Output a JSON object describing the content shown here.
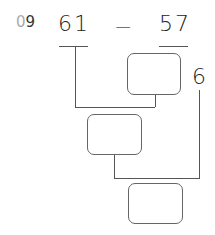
{
  "problem": {
    "number_prefix": "0",
    "number_suffix": "9",
    "left_operand": "61",
    "operator": "−",
    "right_operand": "57",
    "given_part": "6"
  },
  "boxes": [
    {
      "label": "",
      "value": ""
    },
    {
      "label": "",
      "value": ""
    },
    {
      "label": "",
      "value": ""
    }
  ],
  "colors": {
    "line": "#555555",
    "text": "#222222",
    "prefix": "#aaaaaa"
  }
}
